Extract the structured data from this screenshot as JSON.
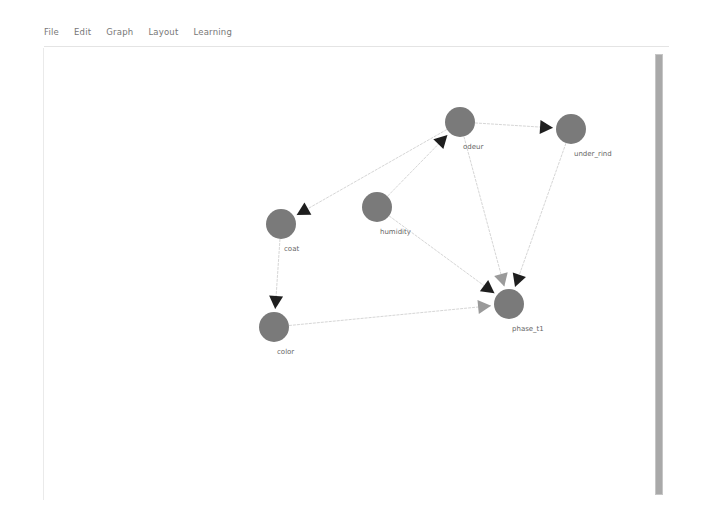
{
  "menubar": {
    "items": [
      {
        "label": "File"
      },
      {
        "label": "Edit"
      },
      {
        "label": "Graph"
      },
      {
        "label": "Layout"
      },
      {
        "label": "Learning"
      }
    ]
  },
  "colors": {
    "node_fill": "#7a7a7a",
    "edge": "#d6d6d6",
    "arrow_dark": "#1e1e1e",
    "arrow_light": "#9a9a9a",
    "scrollbar": "#a9a9a9"
  },
  "graph": {
    "nodes": [
      {
        "id": "odeur",
        "label": "odeur",
        "x": 460,
        "y": 122
      },
      {
        "id": "under_rind",
        "label": "under_rind",
        "x": 571,
        "y": 129
      },
      {
        "id": "coat",
        "label": "coat",
        "x": 281,
        "y": 224
      },
      {
        "id": "humidity",
        "label": "humidity",
        "x": 377,
        "y": 207
      },
      {
        "id": "color",
        "label": "color",
        "x": 274,
        "y": 327
      },
      {
        "id": "phase_t1",
        "label": "phase_t1",
        "x": 509,
        "y": 304
      }
    ],
    "edges": [
      {
        "from": "odeur",
        "to": "under_rind",
        "arrow": "dark"
      },
      {
        "from": "odeur",
        "to": "coat",
        "arrow": "dark"
      },
      {
        "from": "humidity",
        "to": "odeur",
        "arrow": "dark"
      },
      {
        "from": "coat",
        "to": "color",
        "arrow": "dark"
      },
      {
        "from": "humidity",
        "to": "phase_t1",
        "arrow": "dark"
      },
      {
        "from": "odeur",
        "to": "phase_t1",
        "arrow": "light"
      },
      {
        "from": "under_rind",
        "to": "phase_t1",
        "arrow": "dark"
      },
      {
        "from": "color",
        "to": "phase_t1",
        "arrow": "light"
      }
    ]
  }
}
